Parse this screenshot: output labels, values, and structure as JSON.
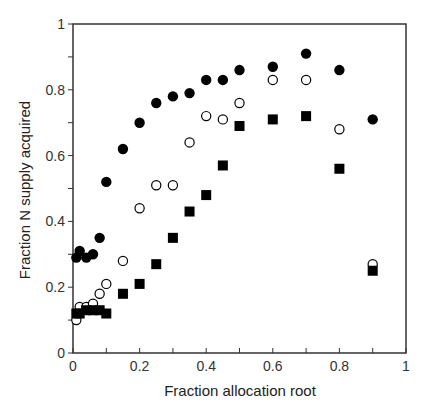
{
  "chart_data": {
    "type": "scatter",
    "title": "",
    "xlabel": "Fraction allocation root",
    "ylabel": "Fraction N supply acquired",
    "xlim": [
      0,
      1
    ],
    "ylim": [
      0,
      1
    ],
    "xticks": [
      0,
      0.2,
      0.4,
      0.6,
      0.8,
      1
    ],
    "xtick_labels": [
      "0",
      "0.2",
      "0.4",
      "0.6",
      "0.8",
      "1"
    ],
    "yticks": [
      0,
      0.2,
      0.4,
      0.6,
      0.8,
      1
    ],
    "ytick_labels": [
      "0",
      "0.2",
      "0.4",
      "0.6",
      "0.8",
      "1"
    ],
    "grid": false,
    "legend": null,
    "series": [
      {
        "name": "filled circles",
        "marker": "circle-filled",
        "x": [
          0.01,
          0.02,
          0.04,
          0.06,
          0.08,
          0.1,
          0.15,
          0.2,
          0.25,
          0.3,
          0.35,
          0.4,
          0.45,
          0.5,
          0.6,
          0.7,
          0.8,
          0.9
        ],
        "y": [
          0.29,
          0.31,
          0.29,
          0.3,
          0.35,
          0.52,
          0.62,
          0.7,
          0.76,
          0.78,
          0.79,
          0.83,
          0.83,
          0.86,
          0.87,
          0.91,
          0.86,
          0.71
        ]
      },
      {
        "name": "open circles",
        "marker": "circle-open",
        "x": [
          0.01,
          0.02,
          0.04,
          0.06,
          0.08,
          0.1,
          0.15,
          0.2,
          0.25,
          0.3,
          0.35,
          0.4,
          0.45,
          0.5,
          0.6,
          0.7,
          0.8,
          0.9
        ],
        "y": [
          0.1,
          0.14,
          0.14,
          0.15,
          0.18,
          0.21,
          0.28,
          0.44,
          0.51,
          0.51,
          0.64,
          0.72,
          0.71,
          0.76,
          0.83,
          0.83,
          0.68,
          0.27
        ]
      },
      {
        "name": "filled squares",
        "marker": "square-filled",
        "x": [
          0.01,
          0.02,
          0.04,
          0.06,
          0.08,
          0.1,
          0.15,
          0.2,
          0.25,
          0.3,
          0.35,
          0.4,
          0.45,
          0.5,
          0.6,
          0.7,
          0.8,
          0.9
        ],
        "y": [
          0.12,
          0.12,
          0.13,
          0.13,
          0.13,
          0.12,
          0.18,
          0.21,
          0.27,
          0.35,
          0.43,
          0.48,
          0.57,
          0.69,
          0.71,
          0.72,
          0.56,
          0.25
        ]
      }
    ]
  }
}
